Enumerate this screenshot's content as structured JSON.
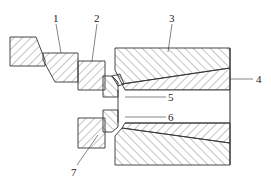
{
  "figure": {
    "type": "mechanical cross-section diagram",
    "labels": [
      {
        "id": "1",
        "text": "1"
      },
      {
        "id": "2",
        "text": "2"
      },
      {
        "id": "3",
        "text": "3"
      },
      {
        "id": "4",
        "text": "4"
      },
      {
        "id": "5",
        "text": "5"
      },
      {
        "id": "6",
        "text": "6"
      },
      {
        "id": "7",
        "text": "7"
      }
    ],
    "colors": {
      "line": "#333333",
      "hatch": "#555555",
      "background": "#ffffff"
    }
  }
}
